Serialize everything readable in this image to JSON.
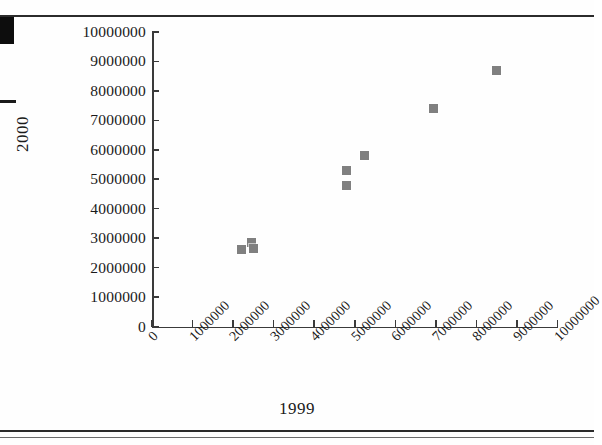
{
  "figure": {
    "marker_color": "#808080",
    "axis_color": "#3a3a3a",
    "background": "#fefefe"
  },
  "chart_data": {
    "type": "scatter",
    "title": "",
    "xlabel": "1999",
    "ylabel": "2000",
    "xlim": [
      0,
      10000000
    ],
    "ylim": [
      0,
      10000000
    ],
    "grid": false,
    "legend": "none",
    "xticks": [
      0,
      1000000,
      2000000,
      3000000,
      4000000,
      5000000,
      6000000,
      7000000,
      8000000,
      9000000,
      10000000
    ],
    "xtick_labels": [
      "0",
      "1000000",
      "2000000",
      "3000000",
      "4000000",
      "5000000",
      "6000000",
      "7000000",
      "8000000",
      "9000000",
      "10000000"
    ],
    "yticks": [
      0,
      1000000,
      2000000,
      3000000,
      4000000,
      5000000,
      6000000,
      7000000,
      8000000,
      9000000,
      10000000
    ],
    "ytick_labels": [
      "0",
      "1000000",
      "2000000",
      "3000000",
      "4000000",
      "5000000",
      "6000000",
      "7000000",
      "8000000",
      "9000000",
      "10000000"
    ],
    "xtick_rotation": -45,
    "points": [
      {
        "x": 2200000,
        "y": 2600000
      },
      {
        "x": 2450000,
        "y": 2850000
      },
      {
        "x": 2500000,
        "y": 2650000
      },
      {
        "x": 4800000,
        "y": 5300000
      },
      {
        "x": 4800000,
        "y": 4800000
      },
      {
        "x": 5250000,
        "y": 5800000
      },
      {
        "x": 6950000,
        "y": 7400000
      },
      {
        "x": 8500000,
        "y": 8700000
      }
    ]
  }
}
